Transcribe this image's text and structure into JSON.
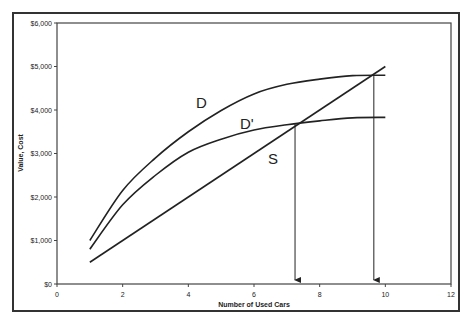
{
  "chart_data": {
    "type": "line",
    "title": "",
    "xlabel": "Number of Used Cars",
    "ylabel": "Value, Cost",
    "xlim": [
      0,
      12
    ],
    "ylim": [
      0,
      6000
    ],
    "x_ticks": [
      "0",
      "2",
      "4",
      "6",
      "8",
      "10",
      "12"
    ],
    "y_ticks": [
      "$0",
      "$1,000",
      "$2,000",
      "$3,000",
      "$4,000",
      "$5,000",
      "$6,000"
    ],
    "grid": false,
    "legend": "none",
    "series": [
      {
        "name": "D",
        "x": [
          1,
          2,
          3,
          4,
          5,
          6,
          7,
          8,
          9,
          10
        ],
        "values": [
          1000,
          2150,
          2900,
          3500,
          3990,
          4370,
          4590,
          4710,
          4790,
          4800
        ]
      },
      {
        "name": "D'",
        "x": [
          1,
          2,
          3,
          4,
          5,
          6,
          7,
          8,
          9,
          10
        ],
        "values": [
          800,
          1820,
          2500,
          3030,
          3330,
          3540,
          3660,
          3750,
          3820,
          3830
        ]
      },
      {
        "name": "S",
        "x": [
          1,
          10
        ],
        "values": [
          500,
          5000
        ]
      }
    ],
    "annotations": [
      {
        "type": "label",
        "text": "D",
        "x": 4.4,
        "y": 4150
      },
      {
        "type": "label",
        "text": "D'",
        "x": 5.8,
        "y": 3650
      },
      {
        "type": "label",
        "text": "S",
        "x": 6.6,
        "y": 2830
      },
      {
        "type": "arrow",
        "from": {
          "x": 7.25,
          "y": 3680
        },
        "to": {
          "x": 7.25,
          "y": 0
        },
        "note": "D' and S intersection"
      },
      {
        "type": "arrow",
        "from": {
          "x": 9.65,
          "y": 4780
        },
        "to": {
          "x": 9.65,
          "y": 0
        },
        "note": "D and S intersection"
      }
    ]
  },
  "labels": {
    "curve_d": "D",
    "curve_d_prime": "D'",
    "curve_s": "S"
  }
}
